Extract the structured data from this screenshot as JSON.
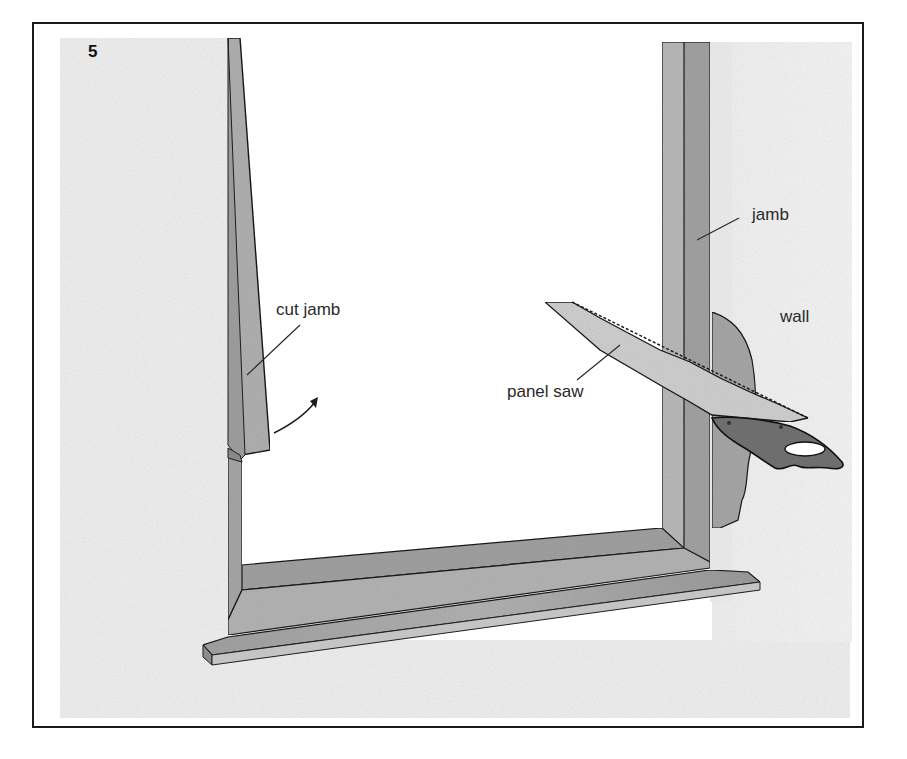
{
  "figure": {
    "number": "5",
    "labels": {
      "cut_jamb": "cut jamb",
      "jamb": "jamb",
      "wall": "wall",
      "panel_saw": "panel saw"
    }
  },
  "colors": {
    "frame_border": "#1a1a1a",
    "wall_shade": "#f1f1f1",
    "wood_light": "#bdbdbd",
    "wood_mid": "#a8a8a8",
    "wood_dark": "#8f8f8f",
    "handle": "#6e6e6e",
    "blade": "#d6d6d6",
    "outline": "#1e1e1e"
  }
}
